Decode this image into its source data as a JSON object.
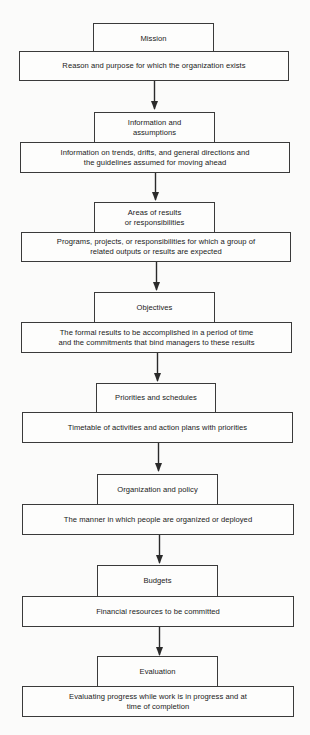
{
  "diagram": {
    "type": "flowchart",
    "direction": "top-to-bottom",
    "colors": {
      "background": "#fbfbfa",
      "line": "#3a3a3a",
      "text": "#1a1a1a"
    },
    "steps": [
      {
        "title": "Mission",
        "description": "Reason and purpose for which the organization exists"
      },
      {
        "title": "Information and\nassumptions",
        "description": "Information on trends, drifts, and general directions and\nthe guidelines assumed for moving ahead"
      },
      {
        "title": "Areas of results\nor responsibilities",
        "description": "Programs, projects, or responsibilities for which a group of\nrelated outputs or results are expected"
      },
      {
        "title": "Objectives",
        "description": "The formal results to be accomplished in a period of time\nand the commitments that bind managers to these results"
      },
      {
        "title": "Priorities and schedules",
        "description": "Timetable of activities and action plans with priorities"
      },
      {
        "title": "Organization and policy",
        "description": "The manner in which people are organized or deployed"
      },
      {
        "title": "Budgets",
        "description": "Financial resources to be committed"
      },
      {
        "title": "Evaluation",
        "description": "Evaluating progress while work is in progress and at\ntime of completion"
      }
    ],
    "connectors": [
      {
        "from": 0,
        "to": 1,
        "icon": "arrow-down-icon"
      },
      {
        "from": 1,
        "to": 2,
        "icon": "arrow-down-icon"
      },
      {
        "from": 2,
        "to": 3,
        "icon": "arrow-down-icon"
      },
      {
        "from": 3,
        "to": 4,
        "icon": "arrow-down-icon"
      },
      {
        "from": 4,
        "to": 5,
        "icon": "arrow-down-icon"
      },
      {
        "from": 5,
        "to": 6,
        "icon": "arrow-down-icon"
      },
      {
        "from": 6,
        "to": 7,
        "icon": "arrow-down-icon"
      }
    ]
  }
}
